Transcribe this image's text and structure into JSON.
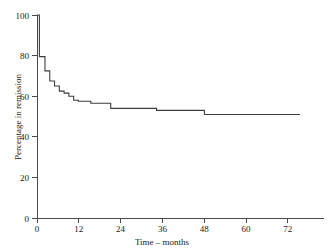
{
  "chart_data": {
    "type": "line",
    "subtype": "kaplan-meier-step",
    "title": "",
    "xlabel": "Time – months",
    "ylabel": "Percentage in remission",
    "xlim": [
      0,
      72
    ],
    "ylim": [
      0,
      100
    ],
    "xticks": [
      0,
      12,
      24,
      36,
      48,
      60,
      72
    ],
    "xtick_labels": [
      "0",
      "12",
      "24",
      "36",
      "48",
      "60",
      "72"
    ],
    "yticks": [
      0,
      20,
      40,
      60,
      80,
      100
    ],
    "ytick_labels": [
      "0",
      "20",
      "40",
      "60",
      "80",
      "100"
    ],
    "grid": false,
    "legend": false,
    "series": [
      {
        "name": "Percentage in remission",
        "color": "#3d3d3d",
        "x": [
          0,
          0.6,
          0.6,
          2.0,
          2.0,
          3.2,
          3.2,
          4.4,
          4.4,
          5.6,
          5.6,
          6.8,
          6.8,
          8.0,
          8.0,
          9.2,
          9.2,
          10.4,
          10.4,
          13.5,
          13.5,
          18.5,
          18.5,
          30.0,
          30.0,
          42.0,
          42.0,
          66.0
        ],
        "y": [
          100,
          100,
          79.5,
          79.5,
          72.5,
          72.5,
          67.5,
          67.5,
          65.0,
          65.0,
          62.5,
          62.5,
          61.5,
          61.5,
          60.0,
          60.0,
          58.0,
          58.0,
          57.5,
          57.5,
          56.5,
          56.5,
          54.0,
          54.0,
          53.0,
          53.0,
          51.0,
          51.0
        ]
      }
    ]
  },
  "axes": {
    "x_title": "Time – months",
    "y_title": "Percentage in remission"
  }
}
